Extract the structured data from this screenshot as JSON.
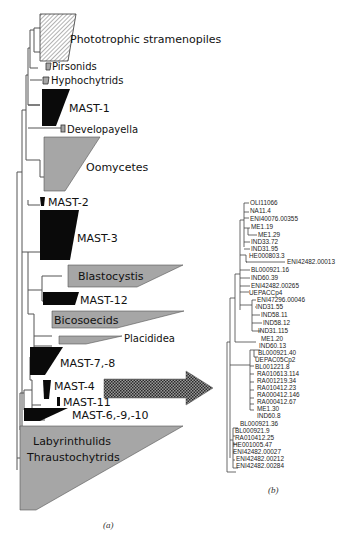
{
  "figure": {
    "panel_a_label": "(a)",
    "panel_b_label": "(b)",
    "colors": {
      "gray_clade": "#a6a6a6",
      "black_clade": "#0a0a0a",
      "hatched_clade": "#ffffff",
      "branch": "#555555"
    }
  },
  "tree_a": {
    "clades": [
      {
        "id": "phototrophic",
        "label": "Phototrophic stramenopiles",
        "fill": "hatched"
      },
      {
        "id": "pirsonids",
        "label": "Pirsonids",
        "fill": "gray"
      },
      {
        "id": "hyphochytrids",
        "label": "Hyphochytrids",
        "fill": "gray"
      },
      {
        "id": "mast1",
        "label": "MAST-1",
        "fill": "black"
      },
      {
        "id": "developayella",
        "label": "Developayella",
        "fill": "gray"
      },
      {
        "id": "oomycetes",
        "label": "Oomycetes",
        "fill": "gray"
      },
      {
        "id": "mast2",
        "label": "MAST-2",
        "fill": "black"
      },
      {
        "id": "mast3",
        "label": "MAST-3",
        "fill": "black"
      },
      {
        "id": "blastocystis",
        "label": "Blastocystis",
        "fill": "gray"
      },
      {
        "id": "mast12",
        "label": "MAST-12",
        "fill": "black"
      },
      {
        "id": "bicosoecids",
        "label": "Bicosoecids",
        "fill": "gray"
      },
      {
        "id": "placididea",
        "label": "Placididea",
        "fill": "gray"
      },
      {
        "id": "mast78",
        "label": "MAST-7,-8",
        "fill": "black"
      },
      {
        "id": "mast4",
        "label": "MAST-4",
        "fill": "black"
      },
      {
        "id": "mast11",
        "label": "MAST-11",
        "fill": "black"
      },
      {
        "id": "mast6910",
        "label": "MAST-6,-9,-10",
        "fill": "black"
      },
      {
        "id": "laby",
        "label_line1": "Labyrinthulids",
        "label_line2": "Thraustochytrids",
        "fill": "gray"
      }
    ],
    "arrow": {
      "from": "MAST-4",
      "to": "tree_b",
      "pattern": "stippled"
    }
  },
  "tree_b": {
    "leaves": [
      "OLI11066",
      "NA11.4",
      "ENI40076.00355",
      "ME1.19",
      "ME1.29",
      "IND33.72",
      "IND31.95",
      "HE000803.3",
      "ENI42482.00013",
      "BL000921.16",
      "IND60.39",
      "ENI42482.00265",
      "UEPACCp4",
      "ENI47296.00046",
      "IND31.55",
      "IND58.11",
      "IND58.12",
      "IND31.115",
      "ME1.20",
      "IND60.13",
      "BL000921.40",
      "UEPAC05Cp2",
      "BL001221.8",
      "RA010613.114",
      "RA001219.34",
      "RA010412.23",
      "RA000412.146",
      "RA000412.67",
      "ME1.30",
      "IND60.8",
      "BL000921.36",
      "BL000921.9",
      "RA010412.25",
      "HE001005.47",
      "ENI42482.00027",
      "ENI42482.00212",
      "ENI42482.00284"
    ]
  }
}
